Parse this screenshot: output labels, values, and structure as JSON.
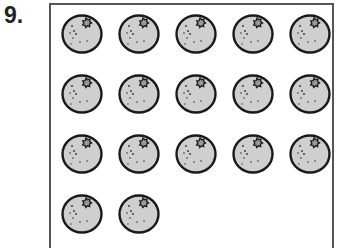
{
  "question": {
    "number": "9."
  },
  "figure": {
    "item": "orange",
    "count": 17,
    "columns": 5,
    "rows": [
      {
        "count": 5
      },
      {
        "count": 5
      },
      {
        "count": 5
      },
      {
        "count": 2
      }
    ],
    "colors": {
      "fill": "#cfcfcf",
      "outline": "#1a1a1a",
      "dots": "#333333"
    }
  }
}
